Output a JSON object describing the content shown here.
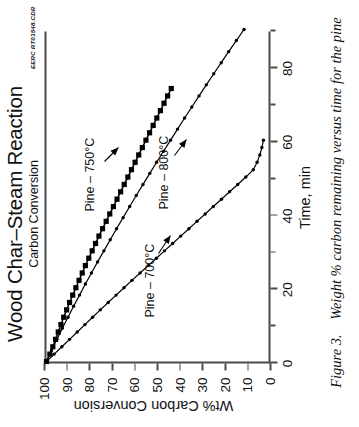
{
  "figure": {
    "caption_label": "Figure 3.",
    "caption_text": "Weight % carbon remaining versus time for the pine",
    "source_code": "EERC RT03548.CDR"
  },
  "chart_data": {
    "type": "line",
    "title": "Wood Char–Steam Reaction",
    "subtitle": "Carbon Conversion",
    "xlabel": "Time, min",
    "ylabel": "Wt% Carbon Conversion",
    "xlim": [
      0,
      90
    ],
    "ylim": [
      0,
      100
    ],
    "y_inverted": true,
    "grid": false,
    "legend": "inline-annotations",
    "xticks": [
      0,
      20,
      40,
      60,
      80
    ],
    "xtick_labels": [
      "0",
      "20",
      "40",
      "60",
      "80"
    ],
    "xminor_ticks": [
      10,
      30,
      50,
      70,
      90
    ],
    "yticks": [
      100,
      90,
      80,
      70,
      60,
      50,
      40,
      30,
      20,
      10,
      0
    ],
    "ytick_labels": [
      "100",
      "90",
      "80",
      "70",
      "60",
      "50",
      "40",
      "30",
      "20",
      "10",
      "0"
    ],
    "series": [
      {
        "name": "Pine – 700°C",
        "marker": "filled-square",
        "color": "#000000",
        "annotation": "Pine – 700°C",
        "x": [
          0,
          2,
          4,
          6,
          8,
          10,
          12,
          14,
          16,
          18,
          20,
          22,
          24,
          26,
          28,
          30,
          32,
          34,
          36,
          38,
          40,
          42,
          44,
          46,
          48,
          50,
          52,
          54,
          56,
          58,
          60,
          62,
          64,
          66,
          68,
          70,
          72,
          74
        ],
        "y": [
          100,
          98.5,
          97.2,
          96.0,
          94.8,
          93.6,
          92.4,
          91.1,
          89.8,
          88.4,
          87.0,
          85.6,
          84.2,
          82.8,
          81.3,
          79.8,
          78.3,
          76.8,
          75.2,
          73.6,
          72.0,
          70.4,
          68.8,
          67.2,
          65.6,
          64.0,
          62.4,
          60.8,
          59.2,
          57.6,
          56.0,
          54.4,
          52.8,
          51.2,
          49.6,
          48.0,
          46.4,
          44.8
        ]
      },
      {
        "name": "Pine – 750°C",
        "marker": "small-diamond",
        "color": "#000000",
        "annotation": "Pine – 750°C",
        "x": [
          0,
          3,
          6,
          9,
          12,
          15,
          18,
          21,
          24,
          27,
          30,
          33,
          36,
          39,
          42,
          45,
          48,
          51,
          54,
          57,
          60,
          63,
          66,
          69,
          72,
          75,
          78,
          81,
          84,
          87,
          90
        ],
        "y": [
          100,
          97.8,
          95.4,
          93.0,
          90.5,
          88.0,
          85.4,
          82.8,
          80.1,
          77.4,
          74.6,
          71.8,
          69.0,
          66.1,
          63.2,
          60.3,
          57.3,
          54.3,
          51.3,
          48.2,
          45.1,
          42.0,
          38.9,
          35.7,
          32.5,
          29.3,
          26.0,
          22.7,
          19.4,
          16.0,
          12.6
        ]
      },
      {
        "name": "Pine – 800°C",
        "marker": "small-diamond",
        "color": "#000000",
        "annotation": "Pine – 800°C",
        "x": [
          0,
          2,
          4,
          6,
          8,
          10,
          12,
          14,
          16,
          18,
          20,
          22,
          24,
          26,
          28,
          30,
          32,
          34,
          36,
          38,
          40,
          42,
          44,
          46,
          48,
          50,
          52,
          54,
          56,
          58,
          60
        ],
        "y": [
          100,
          96.6,
          93.2,
          89.8,
          86.4,
          83.0,
          79.6,
          76.2,
          72.7,
          69.2,
          65.7,
          62.2,
          58.6,
          55.0,
          51.4,
          47.8,
          44.2,
          40.6,
          37.0,
          33.4,
          29.8,
          26.2,
          22.6,
          19.0,
          15.4,
          11.8,
          8.5,
          6.8,
          5.6,
          4.7,
          4.0
        ]
      }
    ]
  }
}
